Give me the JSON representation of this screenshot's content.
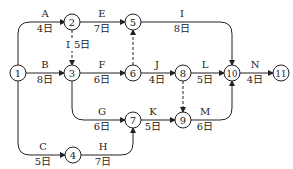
{
  "nodes": [
    {
      "id": "1",
      "x": 18,
      "y": 73
    },
    {
      "id": "2",
      "x": 72,
      "y": 22
    },
    {
      "id": "3",
      "x": 72,
      "y": 73
    },
    {
      "id": "4",
      "x": 73,
      "y": 155
    },
    {
      "id": "5",
      "x": 133,
      "y": 22
    },
    {
      "id": "6",
      "x": 133,
      "y": 73
    },
    {
      "id": "7",
      "x": 133,
      "y": 120
    },
    {
      "id": "8",
      "x": 183,
      "y": 73
    },
    {
      "id": "9",
      "x": 183,
      "y": 120
    },
    {
      "id": "10",
      "x": 232,
      "y": 73
    },
    {
      "id": "11",
      "x": 281,
      "y": 73
    }
  ],
  "activities": [
    {
      "name": "A",
      "duration": "4日",
      "from": "1",
      "to": "2",
      "dashed": false
    },
    {
      "name": "B",
      "duration": "8日",
      "from": "1",
      "to": "3",
      "dashed": false
    },
    {
      "name": "C",
      "duration": "5日",
      "from": "1",
      "to": "4",
      "dashed": false
    },
    {
      "name": "D",
      "duration": "5日",
      "from": "2",
      "to": "3",
      "dashed": true
    },
    {
      "name": "E",
      "duration": "7日",
      "from": "2",
      "to": "5",
      "dashed": false
    },
    {
      "name": "F",
      "duration": "6日",
      "from": "3",
      "to": "6",
      "dashed": false
    },
    {
      "name": "G",
      "duration": "6日",
      "from": "3",
      "to": "7",
      "dashed": false
    },
    {
      "name": "H",
      "duration": "7日",
      "from": "4",
      "to": "7",
      "dashed": false
    },
    {
      "name": "I",
      "duration": "8日",
      "from": "5",
      "to": "10",
      "dashed": false
    },
    {
      "name": "J",
      "duration": "4日",
      "from": "6",
      "to": "8",
      "dashed": false
    },
    {
      "name": "K",
      "duration": "5日",
      "from": "7",
      "to": "9",
      "dashed": false
    },
    {
      "name": "L",
      "duration": "5日",
      "from": "8",
      "to": "10",
      "dashed": false
    },
    {
      "name": "M",
      "duration": "6日",
      "from": "9",
      "to": "10",
      "dashed": false
    },
    {
      "name": "N",
      "duration": "4日",
      "from": "10",
      "to": "11",
      "dashed": false
    }
  ],
  "dummies": [
    {
      "from": "6",
      "to": "5"
    },
    {
      "from": "8",
      "to": "9"
    }
  ],
  "colors": {
    "stroke": "#222222",
    "background": "#ffffff"
  }
}
